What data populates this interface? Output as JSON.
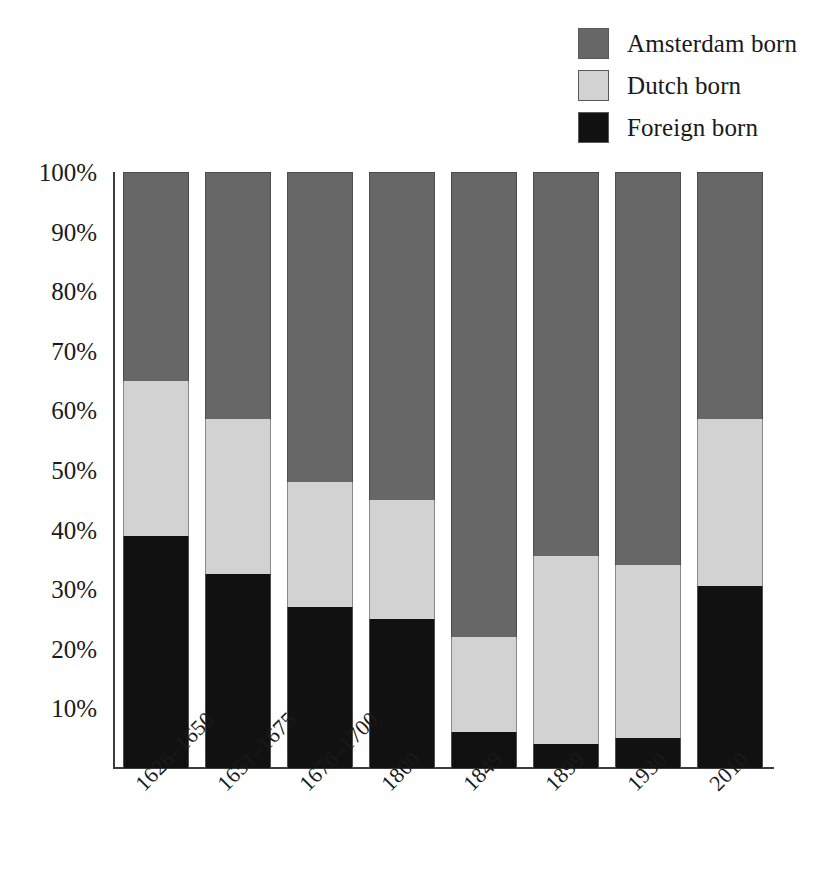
{
  "chart_data": {
    "type": "bar",
    "subtype": "stacked-percentage",
    "title": "",
    "xlabel": "",
    "ylabel": "",
    "ylim": [
      0,
      100
    ],
    "grid": false,
    "legend_position": "top-right",
    "categories": [
      "1626–1650",
      "1651–1675",
      "1676–1700",
      "1800",
      "1849",
      "1899",
      "1930",
      "2010"
    ],
    "ytick_labels": [
      "100%",
      "90%",
      "80%",
      "70%",
      "60%",
      "50%",
      "40%",
      "30%",
      "20%",
      "10%"
    ],
    "ytick_values": [
      100,
      90,
      80,
      70,
      60,
      50,
      40,
      30,
      20,
      10
    ],
    "series": [
      {
        "name": "Foreign born",
        "color": "#111111",
        "values": [
          39,
          32.5,
          27,
          25,
          6,
          4,
          5,
          30.5
        ]
      },
      {
        "name": "Dutch born",
        "color": "#d2d2d2",
        "values": [
          26,
          26,
          21,
          20,
          16,
          31.5,
          29,
          28
        ]
      },
      {
        "name": "Amsterdam born",
        "color": "#676767",
        "values": [
          35,
          41.5,
          52,
          55,
          78,
          64.5,
          66,
          41.5
        ]
      }
    ],
    "stack_boundaries_pct": {
      "foreign_top": [
        39,
        32.5,
        27,
        25,
        6,
        4,
        5,
        30.5
      ],
      "dutch_top": [
        65,
        58.5,
        48,
        45,
        22,
        35.5,
        34,
        58.5
      ]
    }
  },
  "legend": {
    "items": [
      {
        "label": "Amsterdam born",
        "color": "#676767",
        "swatch": "legend-swatch-amsterdam"
      },
      {
        "label": "Dutch born",
        "color": "#d2d2d2",
        "swatch": "legend-swatch-dutch"
      },
      {
        "label": "Foreign born",
        "color": "#111111",
        "swatch": "legend-swatch-foreign"
      }
    ]
  },
  "colors": {
    "amsterdam_born": "#676767",
    "dutch_born": "#d2d2d2",
    "foreign_born": "#111111",
    "axis": "#3b3b3b",
    "background": "#ffffff",
    "text": "#1a1a1a"
  }
}
